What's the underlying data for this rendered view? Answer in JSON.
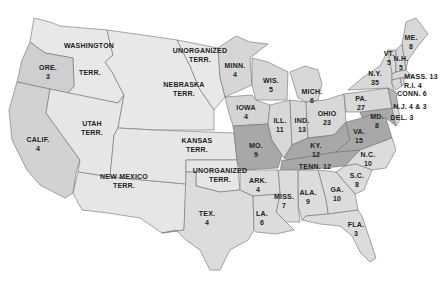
{
  "map": {
    "colors": {
      "background": "#ffffff",
      "territory": "#e6e6e6",
      "free_state": "#d6d6d6",
      "border_state": "#a8a8a8",
      "slave_state": "#dcdcdc",
      "border": "#6e6e6e"
    },
    "regions": [
      {
        "id": "wash",
        "name": "WASHINGTON",
        "sub": "TERR.",
        "x": 89,
        "y": 45,
        "x2": 90,
        "y2": 72
      },
      {
        "id": "ore",
        "name": "ORE.",
        "sub": "3",
        "x": 48,
        "y": 72
      },
      {
        "id": "calif",
        "name": "CALIF.",
        "sub": "4",
        "x": 38,
        "y": 144
      },
      {
        "id": "utah",
        "name": "UTAH",
        "sub": "TERR.",
        "x": 92,
        "y": 128
      },
      {
        "id": "nebr",
        "name": "NEBRASKA",
        "sub": "TERR.",
        "x": 184,
        "y": 89
      },
      {
        "id": "unorg_n",
        "name": "UNORGANIZED",
        "sub": "TERR.",
        "x": 200,
        "y": 55
      },
      {
        "id": "minn",
        "name": "MINN.",
        "sub": "4",
        "x": 235,
        "y": 70
      },
      {
        "id": "wis",
        "name": "WIS.",
        "sub": "5",
        "x": 271,
        "y": 85
      },
      {
        "id": "iowa",
        "name": "IOWA",
        "sub": "4",
        "x": 246,
        "y": 112
      },
      {
        "id": "kansas",
        "name": "KANSAS",
        "sub": "TERR.",
        "x": 197,
        "y": 145
      },
      {
        "id": "nm",
        "name": "NEW MEXICO",
        "sub": "TERR.",
        "x": 124,
        "y": 181
      },
      {
        "id": "unorg_s",
        "name": "UNORGANIZED",
        "sub": "TERR.",
        "x": 220,
        "y": 175
      },
      {
        "id": "mo",
        "name": "MO.",
        "sub": "9",
        "x": 256,
        "y": 150
      },
      {
        "id": "ill",
        "name": "ILL.",
        "sub": "11",
        "x": 280,
        "y": 125
      },
      {
        "id": "ind",
        "name": "IND.",
        "sub": "13",
        "x": 302,
        "y": 125
      },
      {
        "id": "ohio",
        "name": "OHIO",
        "sub": "23",
        "x": 327,
        "y": 118
      },
      {
        "id": "mich",
        "name": "MICH.",
        "sub": "6",
        "x": 312,
        "y": 96
      },
      {
        "id": "ky",
        "name": "KY.",
        "sub": "12",
        "x": 316,
        "y": 150
      },
      {
        "id": "tenn",
        "name": "TENN.",
        "sub": "12",
        "x": 315,
        "y": 166,
        "inline": true
      },
      {
        "id": "va",
        "name": "VA.",
        "sub": "15",
        "x": 359,
        "y": 136
      },
      {
        "id": "nc",
        "name": "N.C.",
        "sub": "10",
        "x": 368,
        "y": 159
      },
      {
        "id": "sc",
        "name": "S.C.",
        "sub": "8",
        "x": 357,
        "y": 180
      },
      {
        "id": "ga",
        "name": "GA.",
        "sub": "10",
        "x": 337,
        "y": 194
      },
      {
        "id": "ala",
        "name": "ALA.",
        "sub": "9",
        "x": 308,
        "y": 197
      },
      {
        "id": "fla",
        "name": "FLA.",
        "sub": "3",
        "x": 356,
        "y": 229
      },
      {
        "id": "miss",
        "name": "MISS.",
        "sub": "7",
        "x": 284,
        "y": 201
      },
      {
        "id": "la",
        "name": "LA.",
        "sub": "6",
        "x": 262,
        "y": 218
      },
      {
        "id": "ark",
        "name": "ARK.",
        "sub": "4",
        "x": 258,
        "y": 185
      },
      {
        "id": "tex",
        "name": "TEX.",
        "sub": "4",
        "x": 207,
        "y": 218
      },
      {
        "id": "pa",
        "name": "PA.",
        "sub": "27",
        "x": 361,
        "y": 103
      },
      {
        "id": "ny",
        "name": "N.Y.",
        "sub": "35",
        "x": 375,
        "y": 78
      },
      {
        "id": "vt",
        "name": "VT.",
        "sub": "5",
        "x": 389,
        "y": 58
      },
      {
        "id": "nh",
        "name": "N.H.",
        "sub": "5",
        "x": 401,
        "y": 63
      },
      {
        "id": "me",
        "name": "ME.",
        "sub": "8",
        "x": 411,
        "y": 42
      },
      {
        "id": "mass",
        "name": "MASS. 13",
        "x": 421,
        "y": 76,
        "inline": true
      },
      {
        "id": "ri",
        "name": "R.I. 4",
        "x": 413,
        "y": 85,
        "inline": true
      },
      {
        "id": "conn",
        "name": "CONN. 6",
        "x": 412,
        "y": 93,
        "inline": true
      },
      {
        "id": "nj",
        "name": "N.J. 4 & 3",
        "x": 410,
        "y:": 106,
        "y": 106,
        "inline": true
      },
      {
        "id": "md",
        "name": "MD.",
        "sub": "8",
        "x": 377,
        "y": 121
      },
      {
        "id": "del",
        "name": "DEL. 3",
        "x": 402,
        "y": 117,
        "inline": true
      }
    ]
  }
}
